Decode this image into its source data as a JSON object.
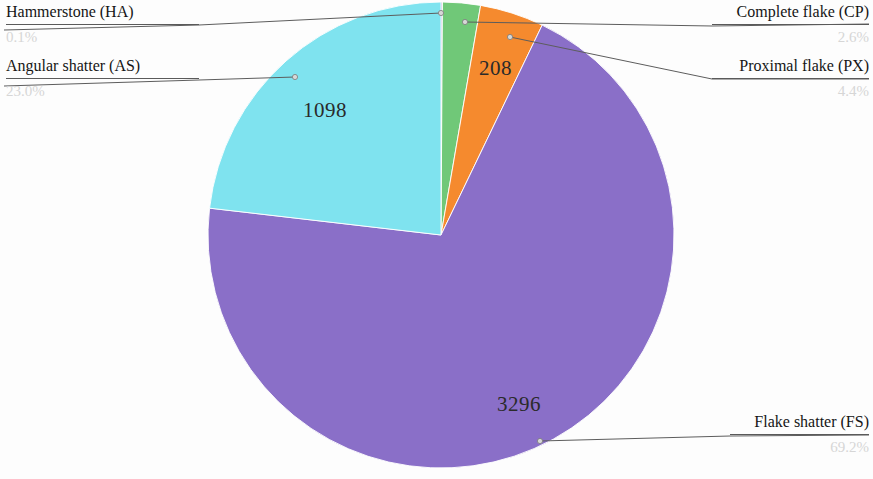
{
  "chart_data": {
    "type": "pie",
    "title": "",
    "subtitle": "",
    "xlabel": "",
    "ylabel": "",
    "legend_position": "callout-labels",
    "grid": false,
    "total": 4761,
    "categories": [
      "Hammerstone (HA)",
      "Complete flake (CP)",
      "Proximal flake (PX)",
      "Flake shatter (FS)",
      "Angular shatter (AS)"
    ],
    "values": [
      4,
      124,
      208,
      3296,
      1098
    ],
    "percent_labels": [
      "0.1%",
      "2.6%",
      "4.4%",
      "69.2%",
      "23.0%"
    ],
    "percents": [
      0.1,
      2.6,
      4.4,
      69.2,
      23.0
    ],
    "visible_value_labels": [
      "",
      "",
      "208",
      "3296",
      "1098"
    ],
    "colors": [
      "#8f7fbf",
      "#70c878",
      "#f58a2e",
      "#8a6fc8",
      "#7fe3ef"
    ],
    "slices": [
      {
        "label": "Hammerstone (HA)",
        "code": "HA",
        "percent_label": "0.1%",
        "percent": 0.1,
        "value_label": "",
        "color": "#8f7fbf"
      },
      {
        "label": "Complete flake (CP)",
        "code": "CP",
        "percent_label": "2.6%",
        "percent": 2.6,
        "value_label": "",
        "color": "#70c878"
      },
      {
        "label": "Proximal flake (PX)",
        "code": "PX",
        "percent_label": "4.4%",
        "percent": 4.4,
        "value_label": "208",
        "color": "#f58a2e"
      },
      {
        "label": "Flake shatter (FS)",
        "code": "FS",
        "percent_label": "69.2%",
        "percent": 69.2,
        "value_label": "3296",
        "color": "#8a6fc8"
      },
      {
        "label": "Angular shatter (AS)",
        "code": "AS",
        "percent_label": "23.0%",
        "percent": 23.0,
        "value_label": "1098",
        "color": "#7fe3ef"
      }
    ]
  },
  "callouts": {
    "hammerstone": {
      "category": "Hammerstone (HA)",
      "percent": "0.1%"
    },
    "angular_shatter": {
      "category": "Angular shatter (AS)",
      "percent": "23.0%"
    },
    "complete_flake": {
      "category": "Complete flake (CP)",
      "percent": "2.6%"
    },
    "proximal_flake": {
      "category": "Proximal flake (PX)",
      "percent": "4.4%"
    },
    "flake_shatter": {
      "category": "Flake shatter (FS)",
      "percent": "69.2%"
    }
  },
  "slice_values": {
    "proximal_flake": "208",
    "flake_shatter": "3296",
    "angular_shatter": "1098"
  }
}
